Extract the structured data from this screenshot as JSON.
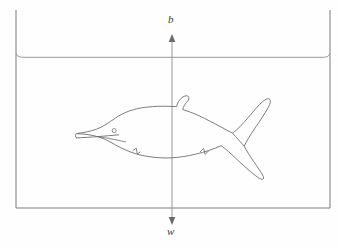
{
  "figure": {
    "name": "dolphin-buoyancy-diagram",
    "background_color": "#fefefe"
  },
  "labels": {
    "buoyancy": "b",
    "weight": "w"
  },
  "colors": {
    "tank_stroke": "#7a7a7a",
    "waterline_stroke": "#8a8a8a",
    "animal_stroke": "#6e6e6e",
    "axis_stroke": "#8f8f8f",
    "arrow_fill": "#6a6a6a",
    "label_text": "#3a3a3a"
  },
  "geometry": {
    "tank": {
      "left_x": 16,
      "right_x": 330,
      "top_y": 10,
      "bottom_y": 208
    },
    "waterline_y": 57,
    "axis_x": 172,
    "arrow_top_y": 36,
    "arrow_bottom_y": 223
  },
  "elements": {
    "tank_name": "water-tank-walls",
    "waterline_name": "water-surface-line",
    "animal_name": "dolphin-silhouette",
    "eye_name": "dolphin-eye",
    "axis_name": "vertical-force-axis",
    "up_arrow_name": "buoyancy-force-arrow",
    "down_arrow_name": "weight-force-arrow"
  }
}
